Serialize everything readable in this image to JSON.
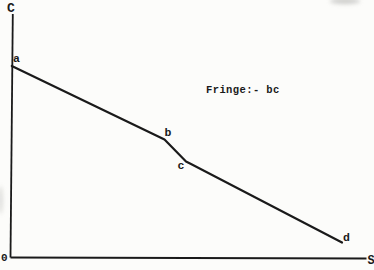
{
  "figure": {
    "background": "#fcfcfa",
    "ink": "#1a1a1a",
    "y_axis_label": "C",
    "x_axis_label": "S",
    "origin_label": "0",
    "annotation": "Fringe:- bc",
    "geometry": {
      "y_axis_px": [
        [
          12.8,
          14
        ],
        [
          10.5,
          257.5
        ]
      ],
      "x_axis_px": [
        [
          10.5,
          257.5
        ],
        [
          366.5,
          258.5
        ]
      ],
      "curve_px": [
        [
          11.8,
          66
        ],
        [
          164.5,
          139.5
        ],
        [
          186,
          161.5
        ],
        [
          191,
          164
        ],
        [
          342,
          242.5
        ]
      ],
      "point_labels": [
        {
          "label": "a",
          "x": 13,
          "y": 61.5
        },
        {
          "label": "b",
          "x": 164.5,
          "y": 136
        },
        {
          "label": "c",
          "x": 177.5,
          "y": 168.5
        },
        {
          "label": "d",
          "x": 343,
          "y": 240.5
        }
      ]
    }
  },
  "chart_data": {
    "type": "line",
    "title": "",
    "xlabel": "S",
    "ylabel": "C",
    "annotation": "Fringe:- bc",
    "grid": false,
    "legend": false,
    "axis_ranges": {
      "x": [
        0,
        1
      ],
      "y": [
        0,
        1
      ]
    },
    "value_basis": "normalized 0-1 estimates; no numeric scale shown on axes",
    "series": [
      {
        "name": "curve a-b-c-d",
        "points": [
          {
            "label": "a",
            "x": 0.0,
            "y": 0.79
          },
          {
            "label": "b",
            "x": 0.43,
            "y": 0.48
          },
          {
            "label": "c",
            "x": 0.5,
            "y": 0.39
          },
          {
            "label": "d",
            "x": 0.93,
            "y": 0.06
          }
        ]
      }
    ]
  }
}
